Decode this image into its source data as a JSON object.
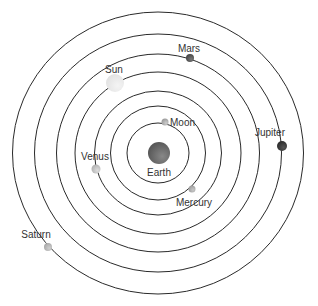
{
  "diagram": {
    "center": {
      "x": 158,
      "y": 153
    },
    "orbits": [
      {
        "rx": 31,
        "ry": 30
      },
      {
        "rx": 47.5,
        "ry": 47
      },
      {
        "rx": 63.5,
        "ry": 62
      },
      {
        "rx": 83,
        "ry": 81
      },
      {
        "rx": 101.5,
        "ry": 99
      },
      {
        "rx": 123.5,
        "ry": 119
      },
      {
        "rx": 145.5,
        "ry": 141
      }
    ],
    "bodies": [
      {
        "name": "Earth",
        "label": "Earth",
        "x": 159,
        "y": 153,
        "r": 11,
        "color": "#555555",
        "highlight": "#888888",
        "label_x": 159,
        "label_y": 176,
        "anchor": "middle"
      },
      {
        "name": "Moon",
        "label": "Moon",
        "x": 165,
        "y": 122,
        "r": 3.5,
        "color": "#999999",
        "highlight": "#cccccc",
        "label_x": 170,
        "label_y": 126,
        "anchor": "start"
      },
      {
        "name": "Mercury",
        "label": "Mercury",
        "x": 192,
        "y": 189,
        "r": 3.5,
        "color": "#9a9a9a",
        "highlight": "#c8c8c8",
        "label_x": 194,
        "label_y": 206,
        "anchor": "middle"
      },
      {
        "name": "Venus",
        "label": "Venus",
        "x": 96,
        "y": 169,
        "r": 4.5,
        "color": "#b0b0b0",
        "highlight": "#dddddd",
        "label_x": 95,
        "label_y": 160,
        "anchor": "middle"
      },
      {
        "name": "Sun",
        "label": "Sun",
        "x": 115,
        "y": 83,
        "r": 9,
        "color": "#e2e2e2",
        "highlight": "#f4f4f4",
        "label_x": 114,
        "label_y": 73,
        "anchor": "middle"
      },
      {
        "name": "Mars",
        "label": "Mars",
        "x": 190,
        "y": 58,
        "r": 4,
        "color": "#444444",
        "highlight": "#777777",
        "label_x": 189,
        "label_y": 52,
        "anchor": "middle"
      },
      {
        "name": "Jupiter",
        "label": "Jupiter",
        "x": 282,
        "y": 146,
        "r": 5,
        "color": "#2a2a2a",
        "highlight": "#555555",
        "label_x": 270,
        "label_y": 136,
        "anchor": "middle"
      },
      {
        "name": "Saturn",
        "label": "Saturn",
        "x": 48,
        "y": 247,
        "r": 4,
        "color": "#a8a8a8",
        "highlight": "#d0d0d0",
        "label_x": 36,
        "label_y": 238,
        "anchor": "middle"
      }
    ]
  }
}
